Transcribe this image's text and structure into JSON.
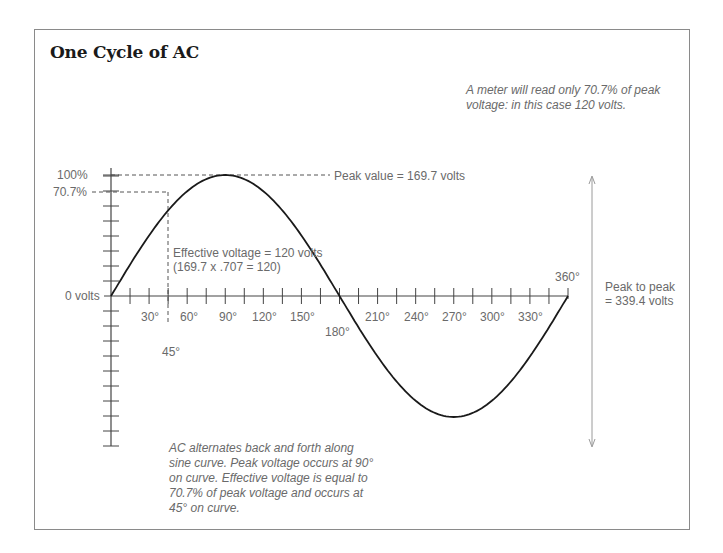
{
  "title": "One Cycle of AC",
  "notes": {
    "meter": [
      "A meter will read only 70.7% of peak",
      "voltage: in this case 120 volts."
    ],
    "peak_value": "Peak value = 169.7 volts",
    "effective": [
      "Effective voltage = 120 volts",
      "(169.7 x .707 = 120)"
    ],
    "peak_to_peak": [
      "Peak to peak",
      "= 339.4 volts"
    ],
    "explanation": [
      "AC alternates back and forth along",
      "sine curve. Peak voltage occurs at 90°",
      "on curve. Effective voltage is equal to",
      "70.7% of peak voltage and occurs at",
      "45° on curve."
    ]
  },
  "y_labels": {
    "top": "100%",
    "effective": "70.7%",
    "zero": "0 volts"
  },
  "x_labels": {
    "above_axis": [
      "30°",
      "60°",
      "90°",
      "120°",
      "150°"
    ],
    "below_axis": [
      "210°",
      "240°",
      "270°",
      "300°",
      "330°"
    ],
    "deg180": "180°",
    "deg360": "360°",
    "deg45": "45°"
  },
  "chart_data": {
    "type": "line",
    "title": "One Cycle of AC",
    "xlabel": "Degrees",
    "ylabel": "Voltage (% of peak)",
    "x": [
      0,
      30,
      45,
      60,
      90,
      120,
      150,
      180,
      210,
      240,
      270,
      300,
      330,
      360
    ],
    "series": [
      {
        "name": "AC sine wave (% of peak)",
        "values": [
          0,
          50,
          70.7,
          86.6,
          100,
          86.6,
          50,
          0,
          -50,
          -86.6,
          -100,
          -86.6,
          -50,
          0
        ]
      }
    ],
    "xlim": [
      0,
      360
    ],
    "ylim": [
      -100,
      100
    ],
    "x_tick_step_degrees": 15,
    "annotations": [
      "Peak value = 169.7 volts",
      "Effective voltage = 120 volts (169.7 x .707 = 120)",
      "Peak to peak = 339.4 volts",
      "A meter will read only 70.7% of peak voltage: in this case 120 volts."
    ],
    "peak_volts": 169.7,
    "effective_volts": 120,
    "peak_to_peak_volts": 339.4,
    "grid": false
  }
}
